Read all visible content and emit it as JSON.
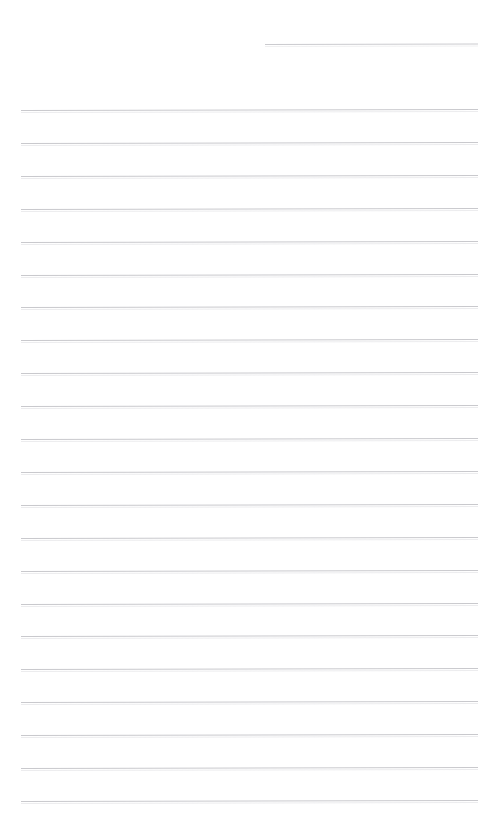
{
  "document": {
    "kind": "lined-paper-scan",
    "title": "",
    "body_text": "",
    "page_width": 498,
    "page_height": 826,
    "background_color": "#ffffff",
    "rule_color": "#c9c9cd",
    "rule_thickness_px": 1,
    "rule_left_x": 21,
    "rule_right_x": 478,
    "rule_spacing_px": 32.9,
    "first_rule_y": 110,
    "rule_count": 22,
    "scan_tilt_deg": -0.12
  },
  "header_rule": {
    "label": "header-rule",
    "x": 265,
    "y": 44,
    "width": 213,
    "color": "#cbcbcf"
  },
  "rules": [
    {
      "index": 1,
      "y": 110.0,
      "x": 21,
      "width": 457
    },
    {
      "index": 2,
      "y": 142.9,
      "x": 21,
      "width": 457
    },
    {
      "index": 3,
      "y": 175.8,
      "x": 21,
      "width": 457
    },
    {
      "index": 4,
      "y": 208.7,
      "x": 21,
      "width": 457
    },
    {
      "index": 5,
      "y": 241.6,
      "x": 21,
      "width": 457
    },
    {
      "index": 6,
      "y": 274.5,
      "x": 21,
      "width": 457
    },
    {
      "index": 7,
      "y": 307.4,
      "x": 21,
      "width": 457
    },
    {
      "index": 8,
      "y": 340.3,
      "x": 21,
      "width": 457
    },
    {
      "index": 9,
      "y": 373.2,
      "x": 21,
      "width": 457
    },
    {
      "index": 10,
      "y": 406.1,
      "x": 21,
      "width": 457
    },
    {
      "index": 11,
      "y": 439.0,
      "x": 21,
      "width": 457
    },
    {
      "index": 12,
      "y": 471.9,
      "x": 21,
      "width": 457
    },
    {
      "index": 13,
      "y": 504.8,
      "x": 21,
      "width": 457
    },
    {
      "index": 14,
      "y": 537.7,
      "x": 21,
      "width": 457
    },
    {
      "index": 15,
      "y": 570.6,
      "x": 21,
      "width": 457
    },
    {
      "index": 16,
      "y": 603.5,
      "x": 21,
      "width": 457
    },
    {
      "index": 17,
      "y": 636.4,
      "x": 21,
      "width": 457
    },
    {
      "index": 18,
      "y": 669.3,
      "x": 21,
      "width": 457
    },
    {
      "index": 19,
      "y": 702.2,
      "x": 21,
      "width": 457
    },
    {
      "index": 20,
      "y": 735.1,
      "x": 21,
      "width": 457
    },
    {
      "index": 21,
      "y": 768.0,
      "x": 21,
      "width": 457
    },
    {
      "index": 22,
      "y": 800.9,
      "x": 21,
      "width": 457
    }
  ]
}
